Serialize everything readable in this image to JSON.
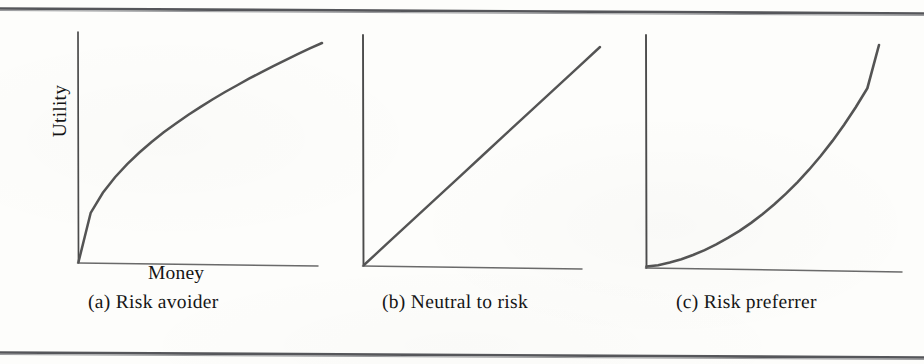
{
  "figure": {
    "background_color": "#fdfdfb",
    "ink_color": "#4b4b4b",
    "text_color": "#141414",
    "rule_color": "#55565a"
  },
  "axis_labels": {
    "y_label": "Utility",
    "x_label": "Money"
  },
  "captions": {
    "a": "(a) Risk avoider",
    "b": "(b) Neutral to risk",
    "c": "(c) Risk preferrer"
  },
  "chart_data": [
    {
      "type": "line",
      "title": "(a) Risk avoider",
      "xlabel": "Money",
      "ylabel": "Utility",
      "shape": "concave",
      "curve_form": "sqrt",
      "grid": false,
      "legend": "none",
      "axis_ticks": [],
      "xlim": [
        0,
        1
      ],
      "ylim": [
        0,
        1
      ],
      "x": [
        0,
        0.05,
        0.1,
        0.15,
        0.2,
        0.25,
        0.3,
        0.35,
        0.4,
        0.45,
        0.5,
        0.55,
        0.6,
        0.65,
        0.7,
        0.75,
        0.8,
        0.85,
        0.9,
        0.95,
        1.0
      ],
      "y": [
        0,
        0.224,
        0.316,
        0.387,
        0.447,
        0.5,
        0.548,
        0.592,
        0.632,
        0.671,
        0.707,
        0.742,
        0.775,
        0.806,
        0.837,
        0.866,
        0.894,
        0.922,
        0.949,
        0.975,
        1.0
      ]
    },
    {
      "type": "line",
      "title": "(b) Neutral to risk",
      "xlabel": "Money",
      "ylabel": "Utility",
      "shape": "linear",
      "curve_form": "identity",
      "grid": false,
      "legend": "none",
      "axis_ticks": [],
      "xlim": [
        0,
        1
      ],
      "ylim": [
        0,
        1
      ],
      "x": [
        0,
        0.1,
        0.2,
        0.3,
        0.4,
        0.5,
        0.6,
        0.7,
        0.8,
        0.9,
        1.0
      ],
      "y": [
        0,
        0.1,
        0.2,
        0.3,
        0.4,
        0.5,
        0.6,
        0.7,
        0.8,
        0.9,
        1.0
      ]
    },
    {
      "type": "line",
      "title": "(c) Risk preferrer",
      "xlabel": "Money",
      "ylabel": "Utility",
      "shape": "convex",
      "curve_form": "power",
      "grid": false,
      "legend": "none",
      "axis_ticks": [],
      "xlim": [
        0,
        1
      ],
      "ylim": [
        0,
        1
      ],
      "x": [
        0,
        0.05,
        0.1,
        0.15,
        0.2,
        0.25,
        0.3,
        0.35,
        0.4,
        0.45,
        0.5,
        0.55,
        0.6,
        0.65,
        0.7,
        0.75,
        0.8,
        0.85,
        0.9,
        0.95,
        1.0
      ],
      "y": [
        0,
        0.006,
        0.018,
        0.033,
        0.052,
        0.074,
        0.1,
        0.129,
        0.161,
        0.197,
        0.237,
        0.281,
        0.329,
        0.381,
        0.438,
        0.5,
        0.567,
        0.64,
        0.719,
        0.805,
        1.0
      ]
    }
  ]
}
